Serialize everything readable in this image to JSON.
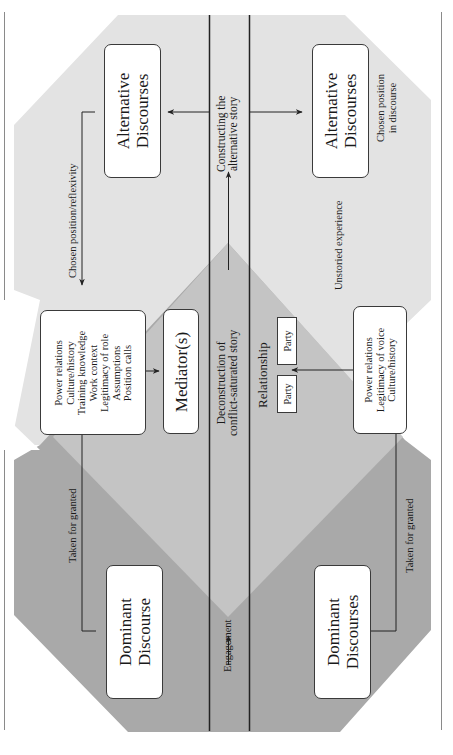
{
  "colors": {
    "light_region": "#e3e3e3",
    "dark_region": "#a9a9a9",
    "overlap_region": "#c4c4c4",
    "lines": "#222222",
    "box_fill": "#ffffff"
  },
  "orientation": "rotated -90deg (text reads bottom-to-top)",
  "columns": {
    "upper_track": {
      "dominant_box": "Dominant Discourse",
      "dominant_lines": [
        "Dominant",
        "Discourse"
      ],
      "taken_for_granted": "Taken for granted",
      "mediator_factors_box": [
        "Power relations",
        "Culture/history",
        "Training knowledge",
        "Work context",
        "Legitimacy of role",
        "Assumptions",
        "Position calls"
      ],
      "mediator_box": "Mediator(s)",
      "chosen_position_label": "Chosen position/reflexivity",
      "alternative_box": [
        "Alternative",
        "Discourses"
      ]
    },
    "center_track": {
      "engagement": "Engagement",
      "deconstruction": [
        "Deconstruction of",
        "conflict-saturated story"
      ],
      "constructing": [
        "Constructing the",
        "alternative story"
      ]
    },
    "lower_track": {
      "relationship_label": "Relationship",
      "party_left": "Party",
      "party_right": "Party",
      "dominant_box": [
        "Dominant",
        "Discourses"
      ],
      "taken_for_granted": "Taken for granted",
      "party_factors_box": [
        "Power relations",
        "Legitimacy of voice",
        "Culture/history"
      ],
      "unstoried_experience": "Unstoried experience",
      "alternative_box": [
        "Alternative",
        "Discourses"
      ],
      "chosen_position_label": [
        "Chosen position",
        "in discourse"
      ]
    }
  }
}
